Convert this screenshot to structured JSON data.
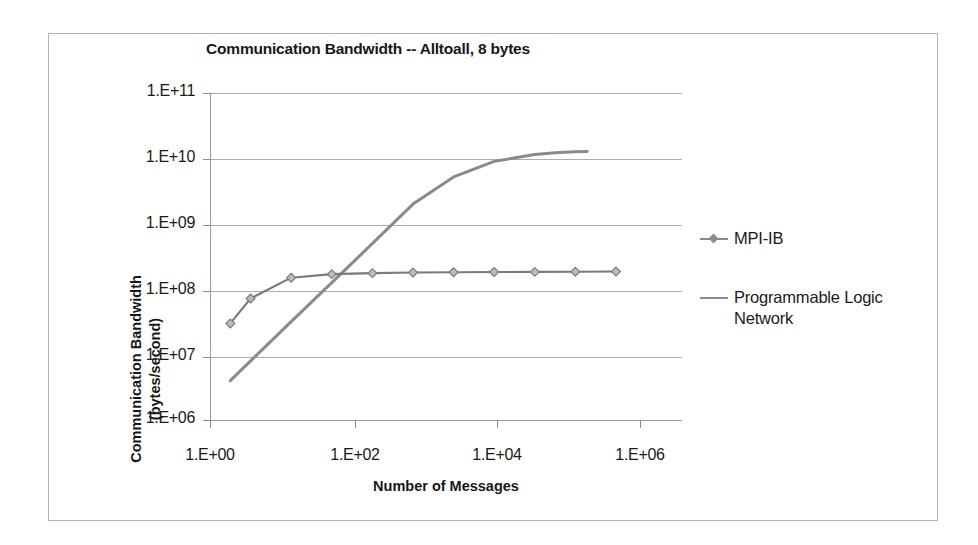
{
  "chart_data": {
    "type": "line",
    "title": "Communication Bandwidth -- Alltoall, 8 bytes",
    "xlabel": "Number of Messages",
    "ylabel": "Communication Bandwidth (bytes/second)",
    "ylabel_line1": "Communication Bandwidth",
    "ylabel_line2": "(bytes/second)",
    "xscale": "log",
    "yscale": "log",
    "xlim": [
      1,
      10000000
    ],
    "ylim": [
      1000000,
      100000000000
    ],
    "grid": "horizontal",
    "legend_position": "right",
    "xticks": [
      "1.E+00",
      "1.E+02",
      "1.E+04",
      "1.E+06"
    ],
    "xtick_values": [
      1,
      100,
      10000,
      1000000
    ],
    "yticks": [
      "1.E+06",
      "1.E+07",
      "1.E+08",
      "1.E+09",
      "1.E+10",
      "1.E+11"
    ],
    "ytick_values": [
      1000000,
      10000000,
      100000000,
      1000000000,
      10000000000,
      100000000000
    ],
    "series": [
      {
        "name": "MPI-IB",
        "marker": "diamond",
        "color": "#7a7a7a",
        "x": [
          2,
          4,
          16,
          64,
          256,
          1024,
          4096,
          16384,
          65536,
          262144,
          1048576
        ],
        "y": [
          30000000,
          72000000,
          150000000,
          170000000,
          176000000,
          180000000,
          182000000,
          183000000,
          184000000,
          185000000,
          186000000
        ]
      },
      {
        "name": "Programmable Logic Network",
        "marker": "none",
        "color": "#8a8a8a",
        "x": [
          2,
          16,
          128,
          1024,
          4096,
          16384,
          65536,
          131072,
          262144,
          393216
        ],
        "y": [
          4000000,
          32000000,
          250000000,
          2000000000,
          5200000000,
          9000000000,
          11500000000,
          12200000000,
          12600000000,
          12800000000
        ]
      }
    ]
  },
  "legend": {
    "entries": [
      {
        "label": "MPI-IB",
        "marker": "diamond-line-marker"
      },
      {
        "label": "Programmable Logic Network",
        "marker": "line-swatch"
      }
    ]
  },
  "colors": {
    "series_mpi": "#7a7a7a",
    "series_pln": "#8a8a8a",
    "gridline": "#adadad",
    "axis": "#9a9a9a",
    "border": "#b4b4b4",
    "text": "#1a1a1a"
  }
}
